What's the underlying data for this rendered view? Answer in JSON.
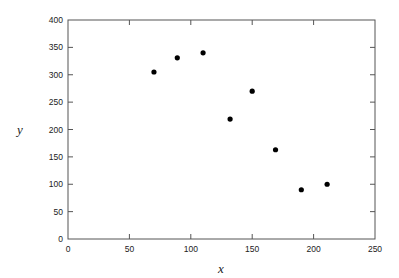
{
  "chart_data": {
    "type": "scatter",
    "title": "",
    "xlabel": "x",
    "ylabel": "y",
    "xlim": [
      0,
      250
    ],
    "ylim": [
      0,
      400
    ],
    "xticks": [
      0,
      50,
      100,
      150,
      200,
      250
    ],
    "yticks": [
      0,
      50,
      100,
      150,
      200,
      250,
      300,
      350,
      400
    ],
    "grid": false,
    "legend": null,
    "series": [
      {
        "name": "data",
        "marker": "filled-circle",
        "color": "#000000",
        "points": [
          {
            "x": 70,
            "y": 305
          },
          {
            "x": 89,
            "y": 331
          },
          {
            "x": 110,
            "y": 340
          },
          {
            "x": 132,
            "y": 219
          },
          {
            "x": 150,
            "y": 270
          },
          {
            "x": 169,
            "y": 163
          },
          {
            "x": 190,
            "y": 90
          },
          {
            "x": 211,
            "y": 100
          }
        ]
      }
    ]
  },
  "colors": {
    "axis": "#555555",
    "marker": "#000000",
    "text": "#222222",
    "background": "#ffffff"
  }
}
